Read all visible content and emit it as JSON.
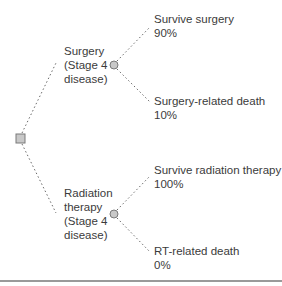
{
  "diagram": {
    "type": "decision-tree",
    "root": {
      "shape": "square",
      "label": ""
    },
    "branches": [
      {
        "label_lines": [
          "Surgery",
          "(Stage 4",
          "disease)"
        ],
        "outcomes": [
          {
            "name": "Survive surgery",
            "probability": "90%"
          },
          {
            "name": "Surgery-related death",
            "probability": "10%"
          }
        ]
      },
      {
        "label_lines": [
          "Radiation",
          "therapy",
          "(Stage 4",
          "disease)"
        ],
        "outcomes": [
          {
            "name": "Survive radiation therapy",
            "probability": "100%"
          },
          {
            "name": "RT-related death",
            "probability": "0%"
          }
        ]
      }
    ],
    "colors": {
      "node_fill": "#c8c8c8",
      "node_stroke": "#7a7a7a",
      "line": "#6a6a6a",
      "text": "#3b3b3b",
      "rule": "#9a9a9a"
    }
  }
}
